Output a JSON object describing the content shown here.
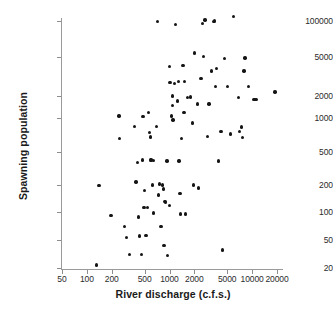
{
  "chart_data": {
    "type": "scatter",
    "title": "",
    "xlabel": "River discharge (c.f.s.)",
    "ylabel": "Spawning population",
    "xscale": "log",
    "yscale": "log",
    "grid": false,
    "legend": null,
    "xticks": [
      50,
      100,
      200,
      500,
      1000,
      2000,
      5000,
      10000,
      20000
    ],
    "xtick_labels": [
      "50",
      "100",
      "200",
      "500",
      "1000",
      "2000",
      "5000",
      "10000",
      "20000"
    ],
    "yticks": [
      20,
      50,
      100,
      200,
      500,
      1000,
      2000,
      5000,
      100000
    ],
    "ytick_labels": [
      "20",
      "50",
      "100",
      "200",
      "500",
      "1000",
      "2000",
      "5000",
      "100000"
    ],
    "xlim": [
      50,
      24000
    ],
    "ylim": [
      18,
      120000
    ],
    "marker": "filled-circle",
    "marker_color": "#151515",
    "n_points": 95,
    "points": [
      {
        "x": 130,
        "y": 22
      },
      {
        "x": 140,
        "y": 196
      },
      {
        "x": 195,
        "y": 92
      },
      {
        "x": 245,
        "y": 1060
      },
      {
        "x": 250,
        "y": 660
      },
      {
        "x": 285,
        "y": 70
      },
      {
        "x": 300,
        "y": 53
      },
      {
        "x": 330,
        "y": 31
      },
      {
        "x": 375,
        "y": 840
      },
      {
        "x": 395,
        "y": 218
      },
      {
        "x": 410,
        "y": 375
      },
      {
        "x": 420,
        "y": 88
      },
      {
        "x": 430,
        "y": 55
      },
      {
        "x": 455,
        "y": 31
      },
      {
        "x": 470,
        "y": 400
      },
      {
        "x": 480,
        "y": 1050
      },
      {
        "x": 490,
        "y": 112
      },
      {
        "x": 500,
        "y": 175
      },
      {
        "x": 520,
        "y": 56
      },
      {
        "x": 545,
        "y": 112
      },
      {
        "x": 560,
        "y": 1200
      },
      {
        "x": 575,
        "y": 745
      },
      {
        "x": 585,
        "y": 680
      },
      {
        "x": 595,
        "y": 405
      },
      {
        "x": 600,
        "y": 398
      },
      {
        "x": 620,
        "y": 200
      },
      {
        "x": 640,
        "y": 98
      },
      {
        "x": 700,
        "y": 840
      },
      {
        "x": 720,
        "y": 95000
      },
      {
        "x": 730,
        "y": 155
      },
      {
        "x": 760,
        "y": 205
      },
      {
        "x": 790,
        "y": 70
      },
      {
        "x": 820,
        "y": 200
      },
      {
        "x": 840,
        "y": 180
      },
      {
        "x": 860,
        "y": 42
      },
      {
        "x": 880,
        "y": 130
      },
      {
        "x": 900,
        "y": 128
      },
      {
        "x": 930,
        "y": 390
      },
      {
        "x": 950,
        "y": 30
      },
      {
        "x": 1000,
        "y": 4000
      },
      {
        "x": 1010,
        "y": 2750
      },
      {
        "x": 1060,
        "y": 1060
      },
      {
        "x": 1080,
        "y": 1480
      },
      {
        "x": 1090,
        "y": 2000
      },
      {
        "x": 1100,
        "y": 960
      },
      {
        "x": 1150,
        "y": 2700
      },
      {
        "x": 1180,
        "y": 75000
      },
      {
        "x": 1250,
        "y": 1700
      },
      {
        "x": 1280,
        "y": 2800
      },
      {
        "x": 1300,
        "y": 390
      },
      {
        "x": 1340,
        "y": 160
      },
      {
        "x": 1360,
        "y": 95
      },
      {
        "x": 1400,
        "y": 660
      },
      {
        "x": 1450,
        "y": 4100
      },
      {
        "x": 1500,
        "y": 1180
      },
      {
        "x": 1520,
        "y": 2800
      },
      {
        "x": 1560,
        "y": 95
      },
      {
        "x": 1640,
        "y": 1900
      },
      {
        "x": 1800,
        "y": 1950
      },
      {
        "x": 1900,
        "y": 900
      },
      {
        "x": 1950,
        "y": 200
      },
      {
        "x": 2000,
        "y": 7000
      },
      {
        "x": 2200,
        "y": 1550
      },
      {
        "x": 2250,
        "y": 185
      },
      {
        "x": 2400,
        "y": 3000
      },
      {
        "x": 2500,
        "y": 80000
      },
      {
        "x": 2600,
        "y": 5300
      },
      {
        "x": 2700,
        "y": 110000
      },
      {
        "x": 2900,
        "y": 690
      },
      {
        "x": 3000,
        "y": 1550
      },
      {
        "x": 3200,
        "y": 3600
      },
      {
        "x": 3400,
        "y": 95000
      },
      {
        "x": 3500,
        "y": 100000
      },
      {
        "x": 3600,
        "y": 2500
      },
      {
        "x": 3700,
        "y": 3800
      },
      {
        "x": 3900,
        "y": 390
      },
      {
        "x": 4200,
        "y": 760
      },
      {
        "x": 4400,
        "y": 36
      },
      {
        "x": 4600,
        "y": 4800
      },
      {
        "x": 5000,
        "y": 2500
      },
      {
        "x": 5500,
        "y": 720
      },
      {
        "x": 6000,
        "y": 145000
      },
      {
        "x": 6800,
        "y": 1900
      },
      {
        "x": 7000,
        "y": 760
      },
      {
        "x": 7400,
        "y": 830
      },
      {
        "x": 7600,
        "y": 670
      },
      {
        "x": 8000,
        "y": 3600
      },
      {
        "x": 8200,
        "y": 4900
      },
      {
        "x": 9000,
        "y": 2500
      },
      {
        "x": 10500,
        "y": 1800
      },
      {
        "x": 10900,
        "y": 1800
      },
      {
        "x": 11200,
        "y": 1800
      },
      {
        "x": 19000,
        "y": 2200
      },
      {
        "x": 640,
        "y": 395
      },
      {
        "x": 1000,
        "y": 118
      }
    ]
  },
  "axes": {
    "y_title": "Spawning population",
    "x_title": "River discharge (c.f.s.)"
  }
}
